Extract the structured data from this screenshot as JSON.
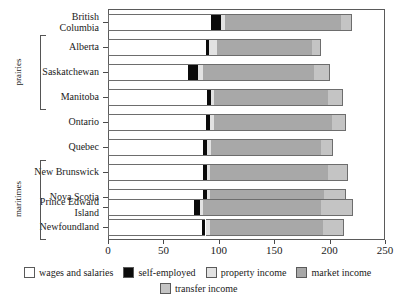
{
  "chart_data": {
    "type": "bar",
    "subtype": "stacked-horizontal",
    "title": "",
    "xlabel": "",
    "ylabel": "",
    "xlim": [
      0,
      250
    ],
    "xticks": [
      0,
      50,
      100,
      150,
      200,
      250
    ],
    "xtick_labels": [
      "0",
      "50",
      "100",
      "150",
      "200",
      "250"
    ],
    "grid": false,
    "legend_position": "bottom",
    "categories": [
      "British\nColumbia",
      "Alberta",
      "Saskatchewan",
      "Manitoba",
      "Ontario",
      "Quebec",
      "New Brunswick",
      "Nova Scotia",
      "Prince Edward\nIsland",
      "Newfoundland"
    ],
    "series": [
      {
        "name": "wages and salaries",
        "color": "#ffffff",
        "values": [
          93,
          88,
          72,
          89,
          88,
          86,
          86,
          86,
          78,
          85
        ]
      },
      {
        "name": "self-employed",
        "color": "#0b0b0b",
        "values": [
          9,
          3,
          9,
          4,
          4,
          3,
          3,
          3,
          5,
          3
        ]
      },
      {
        "name": "property income",
        "color": "#e2e2e2",
        "values": [
          4,
          7,
          5,
          3,
          4,
          4,
          3,
          3,
          3,
          4
        ]
      },
      {
        "name": "market income",
        "color": "#a8a8a8",
        "values": [
          104,
          86,
          100,
          103,
          106,
          99,
          107,
          103,
          106,
          102
        ]
      },
      {
        "name": "transfer income",
        "color": "#c4c4c4",
        "values": [
          10,
          8,
          14,
          13,
          13,
          11,
          18,
          20,
          29,
          19
        ]
      }
    ],
    "groups": [
      {
        "label": "prairies",
        "members": [
          "Alberta",
          "Saskatchewan",
          "Manitoba"
        ]
      },
      {
        "label": "maritimes",
        "members": [
          "New Brunswick",
          "Nova Scotia",
          "Prince Edward Island",
          "Newfoundland"
        ]
      }
    ],
    "legend": [
      {
        "label": "wages and salaries",
        "color": "#ffffff"
      },
      {
        "label": "self-employed",
        "color": "#0b0b0b"
      },
      {
        "label": "property income",
        "color": "#e2e2e2"
      },
      {
        "label": "market income",
        "color": "#a8a8a8"
      },
      {
        "label": "transfer income",
        "color": "#c4c4c4"
      }
    ]
  }
}
